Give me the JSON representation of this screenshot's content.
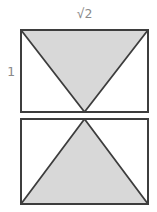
{
  "figure": {
    "width_label": "√2",
    "height_label": "1",
    "colors": {
      "triangle_fill": "#d8d8d8",
      "line": "#3d3d3d",
      "label_text": "#8a8a8a",
      "background": "#ffffff"
    }
  }
}
